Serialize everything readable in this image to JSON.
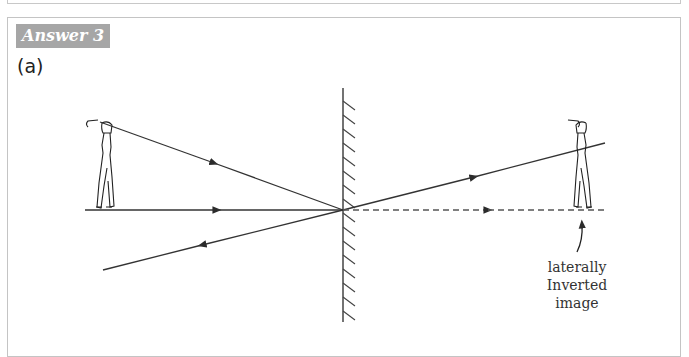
{
  "header": {
    "answer_label": "Answer 3",
    "part_label": "(a)"
  },
  "diagram": {
    "object": "golfer (object)",
    "image": "golfer (image)",
    "caption": {
      "line1": "laterally",
      "line2": "Inverted",
      "line3": "image"
    }
  },
  "colors": {
    "label_bg": "#a6a6a6",
    "line": "#333333",
    "frame": "#c4c4c4"
  }
}
